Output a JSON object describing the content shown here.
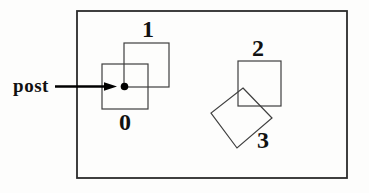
{
  "diagram": {
    "canvas": {
      "width": 369,
      "height": 193
    },
    "colors": {
      "background": "#fdfdfc",
      "frame_stroke": "#2b2b2b",
      "square_stroke": "#3f3f3f",
      "ink": "#000000",
      "text": "#111111"
    },
    "frame": {
      "x": 77,
      "y": 11,
      "width": 270,
      "height": 167,
      "stroke_width": 1.8
    },
    "pointer": {
      "label": "post",
      "shaft": {
        "x1": 55,
        "y1": 86.5,
        "x2": 106,
        "y2": 86.5,
        "stroke_width": 2.6
      },
      "arrowhead_points": "117,86.5 104,82.2 104,90.8",
      "dot": {
        "cx": 124.5,
        "cy": 86.5,
        "r": 3.8
      }
    },
    "squares": [
      {
        "id": "0",
        "label": "0",
        "type": "rect",
        "x": 102,
        "y": 64,
        "width": 46,
        "height": 45
      },
      {
        "id": "1",
        "label": "1",
        "type": "rect",
        "x": 124,
        "y": 43,
        "width": 45,
        "height": 44
      },
      {
        "id": "2",
        "label": "2",
        "type": "rect",
        "x": 238,
        "y": 61,
        "width": 43,
        "height": 45
      },
      {
        "id": "3",
        "label": "3",
        "type": "polygon",
        "points": "243,88 272,118 237,148 211,113"
      }
    ],
    "square_stroke_width": 1.2
  }
}
